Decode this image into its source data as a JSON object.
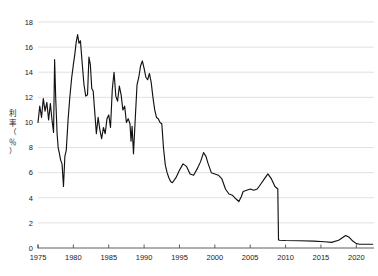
{
  "chart_data": {
    "type": "line",
    "title": "",
    "subtitle": "",
    "xlabel": "",
    "ylabel": "利率（％）",
    "ylabel_chars": [
      "利",
      "率",
      "（",
      "％",
      "）"
    ],
    "xlim": [
      1975,
      2022.5
    ],
    "ylim": [
      0,
      18
    ],
    "x_ticks": [
      1975,
      1980,
      1985,
      1990,
      1995,
      2000,
      2005,
      2010,
      2015,
      2020
    ],
    "x_tick_labels": [
      "1975",
      "1980",
      "1985",
      "1990",
      "1995",
      "2000",
      "2005",
      "2010",
      "2015",
      "2020"
    ],
    "y_ticks": [
      0,
      2,
      4,
      6,
      8,
      10,
      12,
      14,
      16,
      18
    ],
    "y_tick_labels": [
      "0",
      "2",
      "4",
      "6",
      "8",
      "10",
      "12",
      "14",
      "16",
      "18"
    ],
    "grid": true,
    "grid_axis": "y",
    "legend": false,
    "legend_position": "none",
    "line_color": "#121212",
    "grid_color": "#d9d9d9",
    "axis_color": "#4d4d4d",
    "background_color": "#ffffff",
    "series": [
      {
        "name": "利率",
        "color": "#121212",
        "x": [
          1975.0,
          1975.25,
          1975.5,
          1975.75,
          1976.0,
          1976.25,
          1976.5,
          1976.75,
          1977.0,
          1977.2,
          1977.35,
          1977.5,
          1977.7,
          1977.85,
          1978.0,
          1978.2,
          1978.4,
          1978.6,
          1978.8,
          1979.0,
          1979.25,
          1979.5,
          1979.75,
          1980.0,
          1980.2,
          1980.4,
          1980.6,
          1980.8,
          1981.0,
          1981.25,
          1981.5,
          1981.75,
          1982.0,
          1982.2,
          1982.4,
          1982.6,
          1982.8,
          1983.0,
          1983.25,
          1983.5,
          1983.75,
          1984.0,
          1984.25,
          1984.5,
          1984.75,
          1985.0,
          1985.25,
          1985.5,
          1985.75,
          1986.0,
          1986.25,
          1986.5,
          1986.75,
          1987.0,
          1987.25,
          1987.5,
          1987.75,
          1988.0,
          1988.15,
          1988.3,
          1988.5,
          1988.75,
          1989.0,
          1989.25,
          1989.5,
          1989.75,
          1990.0,
          1990.25,
          1990.5,
          1990.75,
          1991.0,
          1991.25,
          1991.5,
          1991.75,
          1992.0,
          1992.25,
          1992.5,
          1992.75,
          1993.0,
          1993.25,
          1993.5,
          1993.75,
          1994.0,
          1994.5,
          1995.0,
          1995.5,
          1996.0,
          1996.5,
          1997.0,
          1997.5,
          1998.0,
          1998.4,
          1998.75,
          1999.0,
          1999.5,
          2000.0,
          2000.5,
          2001.0,
          2001.5,
          2002.0,
          2002.5,
          2003.0,
          2003.4,
          2003.75,
          2004.0,
          2004.5,
          2005.0,
          2005.5,
          2006.0,
          2006.5,
          2007.0,
          2007.5,
          2008.0,
          2008.5,
          2008.9,
          2009.0,
          2009.15,
          2010.0,
          2012.0,
          2014.0,
          2015.5,
          2016.5,
          2017.5,
          2018.5,
          2019.0,
          2019.5,
          2020.0,
          2020.5,
          2021.5,
          2022.3
        ],
        "values": [
          10.0,
          11.3,
          10.4,
          11.9,
          10.9,
          11.6,
          10.2,
          11.5,
          10.1,
          9.2,
          15.0,
          12.0,
          9.1,
          8.0,
          7.6,
          7.0,
          6.7,
          4.9,
          7.3,
          7.8,
          10.2,
          12.0,
          13.5,
          14.6,
          15.4,
          16.4,
          17.0,
          16.3,
          16.5,
          14.7,
          13.0,
          12.1,
          12.2,
          15.2,
          14.6,
          12.7,
          12.5,
          11.0,
          9.1,
          10.4,
          9.4,
          8.7,
          9.6,
          9.1,
          10.3,
          10.6,
          9.6,
          12.6,
          14.0,
          12.1,
          11.7,
          12.9,
          12.2,
          11.0,
          11.3,
          10.0,
          10.3,
          9.9,
          8.5,
          9.7,
          7.5,
          10.3,
          13.0,
          13.6,
          14.5,
          14.9,
          14.3,
          13.6,
          13.4,
          13.9,
          13.2,
          12.0,
          11.0,
          10.4,
          10.3,
          10.0,
          9.9,
          7.9,
          6.6,
          6.0,
          5.6,
          5.3,
          5.2,
          5.6,
          6.2,
          6.7,
          6.5,
          5.9,
          5.8,
          6.3,
          6.9,
          7.6,
          7.3,
          6.8,
          6.0,
          5.9,
          5.8,
          5.5,
          4.7,
          4.3,
          4.2,
          3.9,
          3.7,
          4.1,
          4.5,
          4.6,
          4.7,
          4.6,
          4.7,
          5.1,
          5.5,
          5.9,
          5.5,
          4.9,
          4.7,
          0.65,
          0.62,
          0.6,
          0.58,
          0.55,
          0.5,
          0.45,
          0.62,
          1.0,
          0.85,
          0.55,
          0.35,
          0.3,
          0.3,
          0.3
        ]
      }
    ],
    "annotations": []
  },
  "plot_geometry": {
    "left": 38,
    "right": 374,
    "top": 22,
    "bottom": 248
  }
}
